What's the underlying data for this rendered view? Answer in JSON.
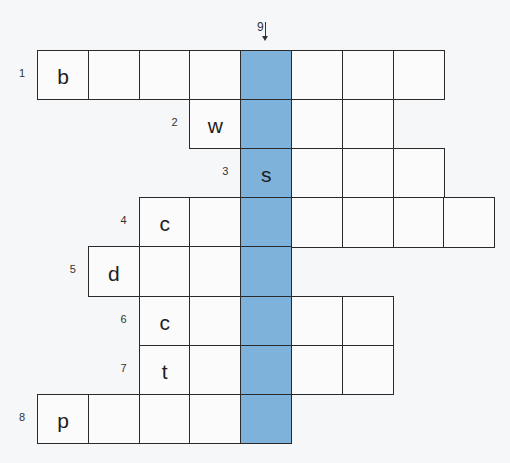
{
  "puzzle": {
    "highlight_color": "#7fb2db",
    "highlight_column": 4,
    "down_clue": {
      "number": "9",
      "direction": "down"
    },
    "rows": [
      {
        "number": "1",
        "start_col": 0,
        "length": 8,
        "first_letter": "b"
      },
      {
        "number": "2",
        "start_col": 3,
        "length": 4,
        "first_letter": "w"
      },
      {
        "number": "3",
        "start_col": 4,
        "length": 4,
        "first_letter": "s"
      },
      {
        "number": "4",
        "start_col": 2,
        "length": 7,
        "first_letter": "c"
      },
      {
        "number": "5",
        "start_col": 1,
        "length": 4,
        "first_letter": "d"
      },
      {
        "number": "6",
        "start_col": 2,
        "length": 5,
        "first_letter": "c"
      },
      {
        "number": "7",
        "start_col": 2,
        "length": 5,
        "first_letter": "t"
      },
      {
        "number": "8",
        "start_col": 0,
        "length": 5,
        "first_letter": "p"
      }
    ]
  }
}
